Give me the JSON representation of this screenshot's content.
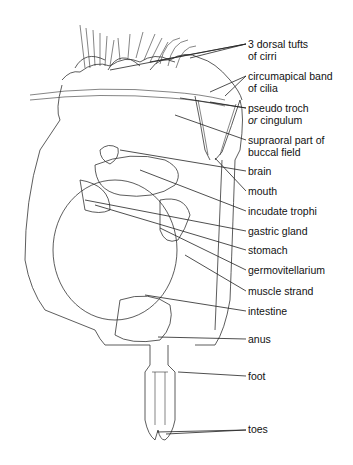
{
  "diagram": {
    "labels": [
      {
        "id": "dorsal-tufts",
        "line1": "3 dorsal tufts",
        "line2": "of cirri",
        "top": 39
      },
      {
        "id": "circumapical-band",
        "line1": "circumapical band",
        "line2": "of cilia",
        "top": 71
      },
      {
        "id": "pseudo-troch",
        "line1": "pseudo troch",
        "line2_prefix": "or",
        "line2": " cingulum",
        "top": 103
      },
      {
        "id": "supraoral",
        "line1": "supraoral part of",
        "line2": "buccal field",
        "top": 135
      },
      {
        "id": "brain",
        "line1": "brain",
        "top": 166
      },
      {
        "id": "mouth",
        "line1": "mouth",
        "top": 186
      },
      {
        "id": "incudate-trophi",
        "line1": "incudate trophi",
        "top": 206
      },
      {
        "id": "gastric-gland",
        "line1": "gastric gland",
        "top": 226
      },
      {
        "id": "stomach",
        "line1": "stomach",
        "top": 245
      },
      {
        "id": "germovitellarium",
        "line1": "germovitellarium",
        "top": 265
      },
      {
        "id": "muscle-strand",
        "line1": "muscle strand",
        "top": 286
      },
      {
        "id": "intestine",
        "line1": "intestine",
        "top": 306
      },
      {
        "id": "anus",
        "line1": "anus",
        "top": 334
      },
      {
        "id": "foot",
        "line1": "foot",
        "top": 371
      },
      {
        "id": "toes",
        "line1": "toes",
        "top": 424
      }
    ]
  }
}
